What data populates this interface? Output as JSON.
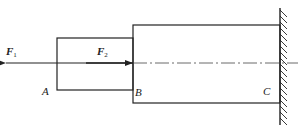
{
  "diagram": {
    "type": "stepped-bar-fixed-end",
    "forces": [
      {
        "id": "F1",
        "label": "F",
        "subscript": "1",
        "direction": "left",
        "applied_at": "A"
      },
      {
        "id": "F2",
        "label": "F",
        "subscript": "2",
        "direction": "right",
        "applied_at": "B"
      }
    ],
    "points": [
      {
        "id": "A",
        "label": "A"
      },
      {
        "id": "B",
        "label": "B"
      },
      {
        "id": "C",
        "label": "C"
      }
    ],
    "segments": [
      {
        "id": "AB",
        "from": "A",
        "to": "B",
        "size": "small"
      },
      {
        "id": "BC",
        "from": "B",
        "to": "C",
        "size": "large"
      }
    ],
    "support": {
      "type": "fixed-wall",
      "side": "right"
    },
    "colors": {
      "stroke": "#222222",
      "background": "#ffffff"
    }
  }
}
